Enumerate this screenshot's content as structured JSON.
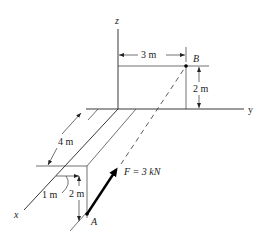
{
  "figure": {
    "axes": {
      "x_label": "x",
      "y_label": "y",
      "z_label": "z"
    },
    "points": {
      "A_label": "A",
      "B_label": "B"
    },
    "force": {
      "label": "F = 3 kN",
      "magnitude_kN": 3,
      "from": "A",
      "toward": "B"
    },
    "dimensions": {
      "B_offset_y": "3 m",
      "B_height_z": "2 m",
      "beam_length_x": "4 m",
      "A_offset": "1 m",
      "A_depth": "2 m"
    }
  }
}
